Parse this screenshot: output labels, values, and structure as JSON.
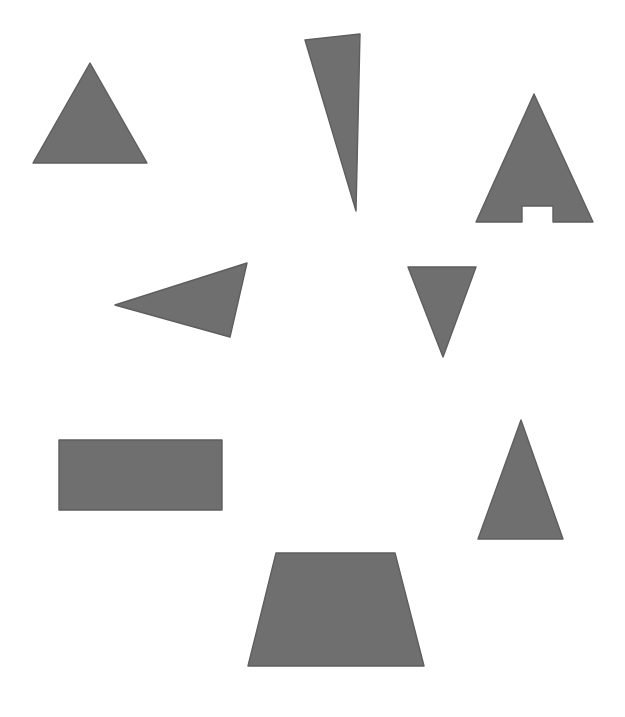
{
  "canvas": {
    "width": 625,
    "height": 717,
    "background": "#ffffff"
  },
  "style": {
    "fill": "#6f6f6f",
    "stroke": "#5e5e5e"
  },
  "shapes": [
    {
      "name": "equilateral-triangle",
      "kind": "triangle",
      "points": "90,63 147,163 33,163"
    },
    {
      "name": "narrow-sliver-triangle",
      "kind": "triangle",
      "points": "305,40 360,34 356,211"
    },
    {
      "name": "notched-triangle",
      "kind": "notched-triangle",
      "points": "534,94 593,222 553,222 553,206 522,206 522,222 476,222"
    },
    {
      "name": "left-pointing-triangle",
      "kind": "triangle",
      "points": "115,305 247,263 230,337"
    },
    {
      "name": "inverted-triangle",
      "kind": "triangle",
      "points": "408,267 476,267 443,357"
    },
    {
      "name": "rectangle",
      "kind": "rectangle",
      "points": "59,440 222,440 222,510 59,510"
    },
    {
      "name": "isosceles-triangle",
      "kind": "triangle",
      "points": "521,420 563,539 478,539"
    },
    {
      "name": "trapezoid",
      "kind": "trapezoid",
      "points": "276,553 395,553 424,666 248,666"
    }
  ]
}
